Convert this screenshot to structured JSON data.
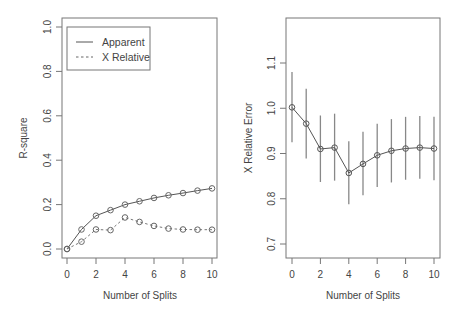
{
  "chart_data": [
    {
      "type": "line",
      "title": "",
      "xlabel": "Number of Splits",
      "ylabel": "R-square",
      "x": [
        0,
        1,
        2,
        3,
        4,
        5,
        6,
        7,
        8,
        9,
        10
      ],
      "xticks": [
        "0",
        "2",
        "4",
        "6",
        "8",
        "10"
      ],
      "yticks": [
        "0.0",
        "0.2",
        "0.4",
        "0.6",
        "0.8",
        "1.0"
      ],
      "ylim": [
        0,
        1
      ],
      "grid": false,
      "legend_position": "top-left",
      "series": [
        {
          "name": "Apparent",
          "linestyle": "solid",
          "marker": "open-circle",
          "values": [
            0.0,
            0.088,
            0.15,
            0.175,
            0.2,
            0.215,
            0.23,
            0.242,
            0.252,
            0.263,
            0.273
          ]
        },
        {
          "name": "X Relative",
          "linestyle": "dashed",
          "marker": "open-circle",
          "values": [
            0.0,
            0.033,
            0.088,
            0.085,
            0.142,
            0.122,
            0.104,
            0.092,
            0.088,
            0.087,
            0.087
          ]
        }
      ]
    },
    {
      "type": "line",
      "title": "",
      "xlabel": "Number of Splits",
      "ylabel": "X Relative Error",
      "x": [
        0,
        1,
        2,
        3,
        4,
        5,
        6,
        7,
        8,
        9,
        10
      ],
      "xticks": [
        "0",
        "2",
        "4",
        "6",
        "8",
        "10"
      ],
      "yticks": [
        "0.7",
        "0.8",
        "0.9",
        "1.0",
        "1.1"
      ],
      "ylim": [
        0.68,
        1.19
      ],
      "grid": false,
      "series": [
        {
          "name": "X Relative Error",
          "linestyle": "solid",
          "marker": "open-circle",
          "values": [
            1.002,
            0.966,
            0.91,
            0.913,
            0.857,
            0.877,
            0.896,
            0.906,
            0.911,
            0.913,
            0.911
          ],
          "error_low": [
            0.925,
            0.889,
            0.837,
            0.84,
            0.788,
            0.808,
            0.826,
            0.836,
            0.842,
            0.844,
            0.841
          ],
          "error_high": [
            1.08,
            1.043,
            0.984,
            0.988,
            0.927,
            0.948,
            0.966,
            0.976,
            0.981,
            0.983,
            0.981
          ]
        }
      ]
    }
  ],
  "labels": {
    "left_xlabel": "Number of Splits",
    "left_ylabel": "R-square",
    "right_xlabel": "Number of Splits",
    "right_ylabel": "X Relative Error",
    "legend_apparent": "Apparent",
    "legend_xrelative": "X Relative"
  }
}
